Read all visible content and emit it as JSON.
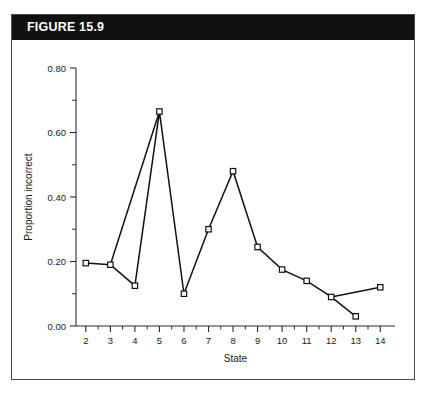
{
  "figure": {
    "header_label": "FIGURE 15.9",
    "header_bg": "#111111",
    "header_text_color": "#ffffff",
    "border_color": "#4a4a4a",
    "background": "#ffffff"
  },
  "chart_data": {
    "type": "line",
    "title": "",
    "xlabel": "State",
    "ylabel": "Proportion incorrect",
    "x": [
      2,
      3,
      4,
      5,
      6,
      7,
      8,
      9,
      10,
      11,
      12,
      13,
      14
    ],
    "values": [
      0.195,
      0.19,
      0.125,
      0.665,
      0.1,
      0.3,
      0.48,
      0.245,
      0.175,
      0.14,
      0.09,
      0.03,
      0.12
    ],
    "series": [
      {
        "name": "main",
        "points": [
          {
            "x": 2,
            "y": 0.195
          },
          {
            "x": 3,
            "y": 0.19
          },
          {
            "x": 4,
            "y": 0.125
          },
          {
            "x": 5,
            "y": 0.665
          },
          {
            "x": 6,
            "y": 0.1
          },
          {
            "x": 7,
            "y": 0.3
          },
          {
            "x": 8,
            "y": 0.48
          },
          {
            "x": 9,
            "y": 0.245
          },
          {
            "x": 10,
            "y": 0.175
          },
          {
            "x": 11,
            "y": 0.14
          },
          {
            "x": 12,
            "y": 0.09
          },
          {
            "x": 13,
            "y": 0.03
          }
        ]
      },
      {
        "name": "branch-3-to-5",
        "points": [
          {
            "x": 3,
            "y": 0.19
          },
          {
            "x": 5,
            "y": 0.665
          }
        ]
      },
      {
        "name": "branch-12-to-14",
        "points": [
          {
            "x": 12,
            "y": 0.09
          },
          {
            "x": 14,
            "y": 0.12
          }
        ]
      }
    ],
    "xlim": [
      1.6,
      14.6
    ],
    "ylim": [
      0.0,
      0.8
    ],
    "x_ticks": [
      2,
      3,
      4,
      5,
      6,
      7,
      8,
      9,
      10,
      11,
      12,
      13,
      14
    ],
    "x_tick_labels": [
      "2",
      "3",
      "4",
      "5",
      "6",
      "7",
      "8",
      "9",
      "10",
      "11",
      "12",
      "13",
      "14"
    ],
    "y_ticks": [
      0.0,
      0.2,
      0.4,
      0.6,
      0.8
    ],
    "y_tick_labels": [
      "0.00",
      "0.20",
      "0.40",
      "0.60",
      "0.80"
    ],
    "y_minor_ticks": [
      0.1,
      0.3,
      0.5,
      0.7
    ],
    "grid": false,
    "legend": null,
    "marker": "open-square",
    "line_color": "#111111",
    "marker_face_color": "#ffffff",
    "marker_edge_color": "#111111"
  }
}
